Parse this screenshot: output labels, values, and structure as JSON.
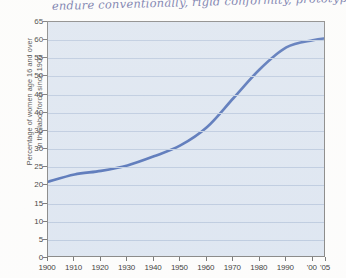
{
  "annotation": {
    "text": "endure conventionally, rigid conformity, prototype",
    "ink_color": "#5a5f9c"
  },
  "chart_data": {
    "type": "line",
    "title": "",
    "xlabel": "",
    "ylabel": "Percentage of women age 16 and over in the labor force since 1900",
    "ylabel_line1": "Percentage of women age 16 and over",
    "ylabel_line2": "in the labor force since 1900",
    "categories": [
      "1900",
      "1910",
      "1920",
      "1930",
      "1940",
      "1950",
      "1960",
      "1970",
      "1980",
      "1990",
      "'00",
      "'05"
    ],
    "x": [
      1900,
      1910,
      1920,
      1930,
      1940,
      1950,
      1960,
      1970,
      1980,
      1990,
      2000,
      2005
    ],
    "values": [
      21,
      23,
      24,
      25.5,
      28,
      31,
      36,
      44,
      52,
      58,
      60,
      60.5
    ],
    "series": [
      {
        "name": "Percentage of women age 16 and over in the labor force",
        "values": [
          21,
          23,
          24,
          25.5,
          28,
          31,
          36,
          44,
          52,
          58,
          60,
          60.5
        ]
      }
    ],
    "ylim": [
      0,
      65
    ],
    "yticks": [
      0,
      5,
      10,
      15,
      20,
      25,
      30,
      35,
      40,
      45,
      50,
      55,
      60,
      65
    ],
    "ytick_labels": [
      "0",
      "5",
      "10",
      "15",
      "20",
      "25",
      "30",
      "35",
      "40",
      "45",
      "50",
      "55",
      "60",
      "65"
    ],
    "xlim": [
      1900,
      2005
    ],
    "grid": true,
    "legend": "none",
    "line_color": "#4a6bb5",
    "plot_background": "#dce5f2",
    "grid_color": "#b9c8df"
  }
}
